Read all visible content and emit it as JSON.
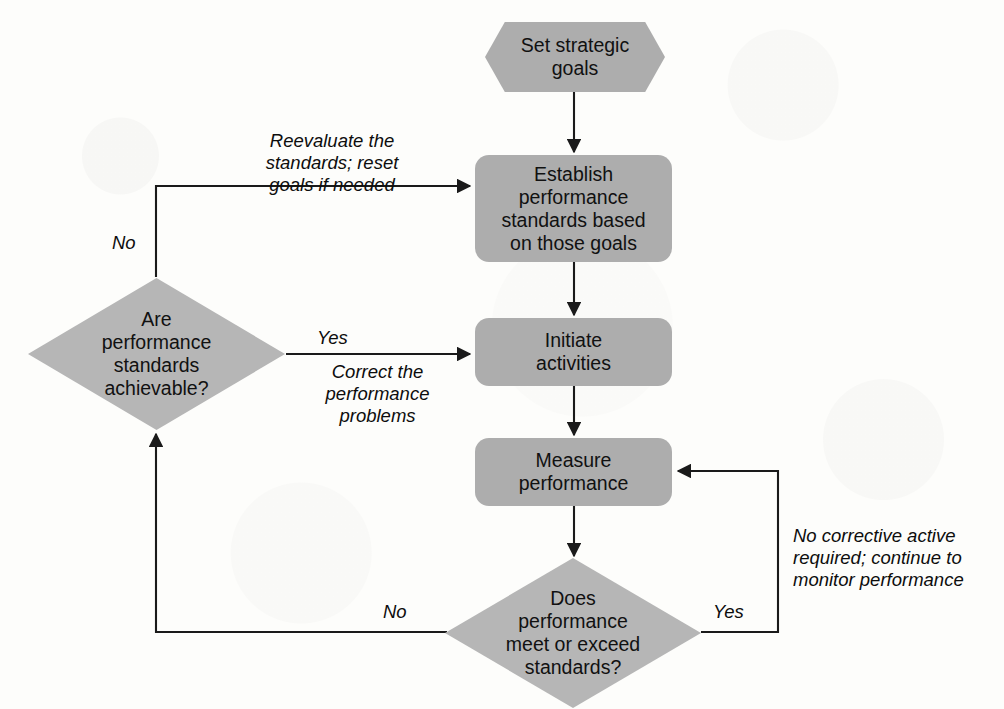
{
  "diagram": {
    "fill_color": "#adadad",
    "diamond_fill_color": "#b6b6b6",
    "line_color": "#1a1a1a",
    "text_color": "#111111",
    "background_color": "#fdfdfb"
  },
  "nodes": {
    "set_goals": "Set strategic\ngoals",
    "establish_standards": "Establish\nperformance\nstandards based\non those goals",
    "initiate": "Initiate\nactivities",
    "measure": "Measure\nperformance",
    "achievable": "Are\nperformance\nstandards\nachievable?",
    "meets": "Does\nperformance\nmeet or exceed\nstandards?"
  },
  "edge_labels": {
    "reevaluate": "Reevaluate the\nstandards; reset\ngoals if needed",
    "no_left_top": "No",
    "yes_left": "Yes",
    "correct": "Correct the\nperformance\nproblems",
    "no_corrective": "No corrective active\nrequired; continue to\nmonitor performance",
    "no_bottom": "No",
    "yes_bottom": "Yes"
  }
}
